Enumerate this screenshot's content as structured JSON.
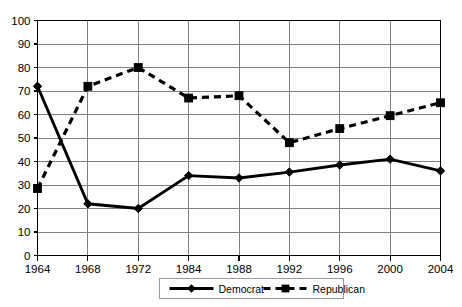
{
  "chart_data": {
    "type": "line",
    "title": "",
    "subtitle": "",
    "xlabel": "",
    "ylabel": "",
    "categories": [
      "1964",
      "1968",
      "1972",
      "1984",
      "1988",
      "1992",
      "1996",
      "2000",
      "2004"
    ],
    "series": [
      {
        "name": "Democrat",
        "marker": "diamond",
        "line_style": "solid",
        "color": "#000000",
        "values": [
          72,
          22,
          20,
          34,
          33,
          35.5,
          38.5,
          41,
          36
        ]
      },
      {
        "name": "Republican",
        "marker": "square",
        "line_style": "dashed",
        "color": "#000000",
        "values": [
          28.5,
          72,
          80,
          67,
          68,
          48,
          54,
          59.5,
          65
        ]
      }
    ],
    "ylim": [
      0,
      100
    ],
    "ytick_step": 10,
    "yticks": [
      "0",
      "10",
      "20",
      "30",
      "40",
      "50",
      "60",
      "70",
      "80",
      "90",
      "100"
    ],
    "grid": {
      "horizontal": true,
      "vertical": true,
      "color": "#808080"
    },
    "legend": {
      "position": "bottom-center",
      "entries": [
        "Democrat",
        "Republican"
      ]
    },
    "plot_border_color": "#000000",
    "background_color": "#ffffff"
  }
}
